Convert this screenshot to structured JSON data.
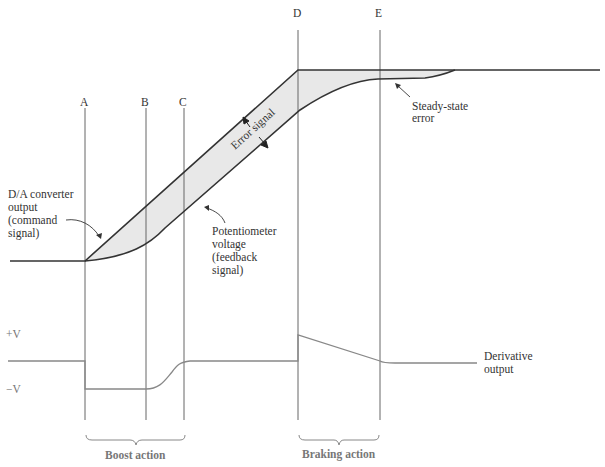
{
  "diagram": {
    "markers": [
      {
        "id": "A",
        "label": "A"
      },
      {
        "id": "B",
        "label": "B"
      },
      {
        "id": "C",
        "label": "C"
      },
      {
        "id": "D",
        "label": "D"
      },
      {
        "id": "E",
        "label": "E"
      }
    ],
    "annotations": {
      "command_signal": [
        "D/A converter",
        "output",
        "(command",
        "signal)"
      ],
      "feedback_signal": [
        "Potentiometer",
        "voltage",
        "(feedback",
        "signal)"
      ],
      "error_signal": "Error signal",
      "steady_state_error": [
        "Steady-state",
        "error"
      ],
      "derivative_output": [
        "Derivative",
        "output"
      ],
      "plus_v": "+V",
      "minus_v": "−V",
      "boost_action": "Boost action",
      "braking_action": "Braking action"
    },
    "colors": {
      "command_line": "#333333",
      "error_fill": "#e8e8e8",
      "derivative_line": "#888888",
      "marker_line": "#555555"
    }
  }
}
